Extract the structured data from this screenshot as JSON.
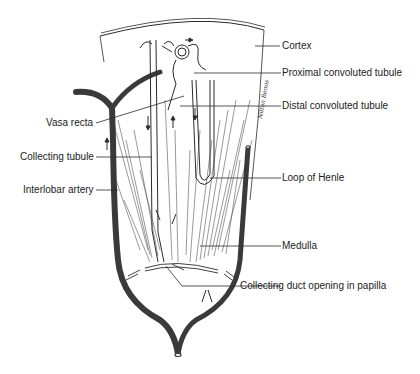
{
  "diagram": {
    "labels": {
      "cortex": "Cortex",
      "proximal": "Proximal convoluted tubule",
      "distal": "Distal convoluted tubule",
      "vasa_recta": "Vasa recta",
      "collecting_tubule": "Collecting tubule",
      "interlobar_artery": "Interlobar artery",
      "loop_of_henle": "Loop of Henle",
      "medulla": "Medulla",
      "collecting_duct_opening": "Collecting duct opening in papilla"
    },
    "signature": "Nilton Bemis",
    "colors": {
      "ink": "#2b2b2b",
      "vessel": "#3a3a3a",
      "background": "#ffffff"
    }
  }
}
